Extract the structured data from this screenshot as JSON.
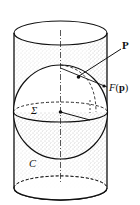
{
  "figure": {
    "labels": {
      "point": "P",
      "projection_func": "F",
      "projection_arg": "p",
      "sphere": "Σ",
      "cylinder": "C"
    },
    "colors": {
      "ink": "#111111",
      "stipple": "#8a8a8a",
      "background": "#ffffff"
    }
  }
}
